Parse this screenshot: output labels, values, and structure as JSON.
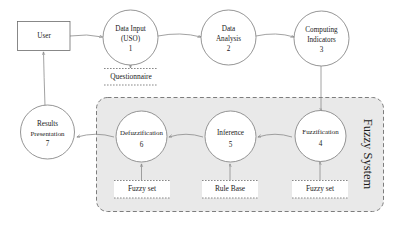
{
  "diagram": {
    "background_color": "#ffffff",
    "system_fill_color": "#e9e9e9",
    "stroke_color": "#6b6b6b"
  },
  "external_entity": {
    "label": "User"
  },
  "processes": [
    {
      "id": "p1",
      "name": "Data Input",
      "name2": "(USO)",
      "number": "1"
    },
    {
      "id": "p2",
      "name": "Data",
      "name2": "Analysis",
      "number": "2"
    },
    {
      "id": "p3",
      "name": "Computing",
      "name2": "Indicators",
      "number": "3"
    },
    {
      "id": "p4",
      "name": "Fuzzification",
      "name2": "",
      "number": "4"
    },
    {
      "id": "p5",
      "name": "Inference",
      "name2": "",
      "number": "5"
    },
    {
      "id": "p6",
      "name": "Defuzzification",
      "name2": "",
      "number": "6"
    },
    {
      "id": "p7",
      "name": "Results",
      "name2": "Presentation",
      "number": "7"
    }
  ],
  "data_stores": [
    {
      "id": "d1",
      "label": "Questionnaire"
    },
    {
      "id": "d2",
      "label": "Fuzzy set"
    },
    {
      "id": "d3",
      "label": "Rule Base"
    },
    {
      "id": "d4",
      "label": "Fuzzy set"
    }
  ],
  "system_boundary": {
    "label": "Fuzzy System"
  }
}
